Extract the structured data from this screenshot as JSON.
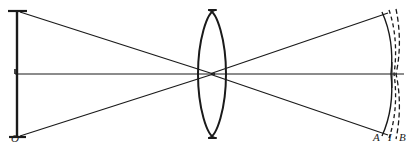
{
  "figure": {
    "kind": "optical-ray-diagram",
    "width": 411,
    "height": 148,
    "background_color": "#ffffff",
    "ink_color": "#1a1a1a"
  },
  "labels": {
    "object": "O",
    "surface_a": "A",
    "surface_i": "I",
    "surface_b": "B"
  },
  "label_positions": {
    "object": {
      "x": 11,
      "y": 133
    },
    "surface_a": {
      "x": 373,
      "y": 132
    },
    "surface_i": {
      "x": 387,
      "y": 132
    },
    "surface_b": {
      "x": 399,
      "y": 132
    }
  },
  "geometry": {
    "optical_axis": {
      "x1": 15,
      "y1": 74,
      "x2": 405,
      "y2": 74
    },
    "axis_tick": {
      "x1": 15,
      "y1": 70,
      "x2": 22,
      "y2": 74
    },
    "object_line": {
      "x": 17,
      "y_top": 12,
      "y_bottom": 137
    },
    "object_tick_top": {
      "x1": 8,
      "y1": 11,
      "x2": 27,
      "y2": 11
    },
    "object_tick_bottom": {
      "x1": 9,
      "y1": 137,
      "x2": 26,
      "y2": 137
    },
    "lens": {
      "center_x": 212,
      "center_y": 74,
      "half_height": 64,
      "half_width": 13,
      "flat_cap": 5
    },
    "crossing_point": {
      "x": 214,
      "y": 74
    },
    "rays": [
      {
        "name": "ray-top-incident",
        "x1": 20,
        "y1": 12,
        "x2": 214,
        "y2": 74
      },
      {
        "name": "ray-bottom-incident",
        "x1": 20,
        "y1": 136,
        "x2": 214,
        "y2": 74
      },
      {
        "name": "ray-top-emergent",
        "x1": 214,
        "y1": 74,
        "x2": 386,
        "y2": 14
      },
      {
        "name": "ray-bottom-emergent",
        "x1": 214,
        "y1": 74,
        "x2": 386,
        "y2": 134
      }
    ],
    "image_surfaces": [
      {
        "name": "surface-A",
        "label": "A",
        "style": "solid",
        "top_end": {
          "x": 382,
          "y": 12
        },
        "axis_end": {
          "x": 392,
          "y": 74
        },
        "bottom_end": {
          "x": 382,
          "y": 136
        },
        "curvature": 12
      },
      {
        "name": "surface-I",
        "label": "I",
        "style": "dashed",
        "top_end": {
          "x": 389,
          "y": 10
        },
        "axis_end": {
          "x": 394,
          "y": 74
        },
        "bottom_end": {
          "x": 389,
          "y": 138
        },
        "curvature": 9
      },
      {
        "name": "surface-B",
        "label": "B",
        "style": "dashed",
        "top_end": {
          "x": 396,
          "y": 9
        },
        "axis_end": {
          "x": 396,
          "y": 74
        },
        "bottom_end": {
          "x": 396,
          "y": 139
        },
        "curvature": 5
      }
    ]
  }
}
